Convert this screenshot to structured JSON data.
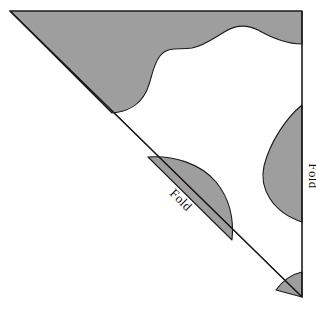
{
  "figure": {
    "type": "geometry-diagram",
    "canvas": {
      "width": 316,
      "height": 310
    },
    "background_color": "#ffffff",
    "shaded_color": "#9e9e9e",
    "outline_color": "#1a1a1a",
    "outline_width": 1.1
  },
  "triangle": {
    "name": "right-triangle",
    "vertices": [
      {
        "name": "top-left-apex",
        "x": 10,
        "y": 11
      },
      {
        "name": "top-right",
        "x": 302,
        "y": 11
      },
      {
        "name": "bottom-right",
        "x": 302,
        "y": 297
      }
    ],
    "edges": [
      {
        "name": "top-edge",
        "from": "top-left-apex",
        "to": "top-right"
      },
      {
        "name": "right-edge",
        "from": "top-right",
        "to": "bottom-right",
        "label": "Fold"
      },
      {
        "name": "hypotenuse",
        "from": "top-left-apex",
        "to": "bottom-right",
        "label": "Fold"
      }
    ]
  },
  "labels": {
    "diagonal_fold": {
      "text": "Fold",
      "x": 178,
      "y": 203,
      "rotation_deg": 45
    },
    "right_fold": {
      "text": "Fold",
      "x": 309,
      "y": 176,
      "rotation_deg": 90
    }
  },
  "regions": [
    {
      "name": "upper-left-shaded-region",
      "fill": "#9e9e9e",
      "description": "Large shaded area along top edge and hypotenuse with S-curve inner boundary"
    },
    {
      "name": "right-edge-lens-blob",
      "fill": "#9e9e9e",
      "description": "Leaf/lens shaped shaded blob attached to the right fold edge"
    },
    {
      "name": "center-quarter-blob",
      "fill": "#9e9e9e",
      "description": "Quarter-round shaded blob resting on the hypotenuse fold line"
    },
    {
      "name": "bottom-right-wedge",
      "fill": "#9e9e9e",
      "description": "Small shaded wedge at the bottom right corner"
    }
  ]
}
